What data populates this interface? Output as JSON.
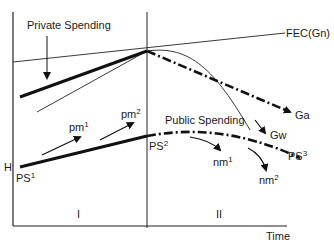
{
  "labels": {
    "private_spending": "Private Spending",
    "public_spending": "Public Spending",
    "fec": "FEC(Gn)",
    "ga": "Ga",
    "gw": "Gw",
    "h": "H",
    "ps1_base": "PS",
    "ps1_sup": "1",
    "ps2_base": "PS",
    "ps2_sup": "2",
    "ps3_base": "PS",
    "ps3_sup": "3",
    "pm1_base": "pm",
    "pm1_sup": "1",
    "pm2_base": "pm",
    "pm2_sup": "2",
    "nm1_base": "nm",
    "nm1_sup": "1",
    "nm2_base": "nm",
    "nm2_sup": "2",
    "phase1": "I",
    "phase2": "II",
    "x_axis": "Time"
  }
}
